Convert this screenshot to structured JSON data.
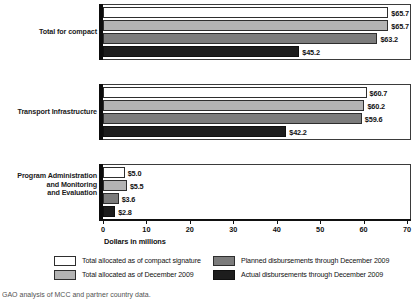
{
  "chart_data": {
    "type": "bar",
    "orientation": "horizontal",
    "title": "",
    "xlabel": "Dollars in millions",
    "ylabel": "",
    "xlim": [
      0,
      70
    ],
    "xticks": [
      "0",
      "10",
      "20",
      "30",
      "40",
      "50",
      "60",
      "70"
    ],
    "grid": false,
    "legend_position": "bottom",
    "categories": [
      "Total for compact",
      "Transport Infrastructure",
      "Program Administration and Monitoring and Evaluation"
    ],
    "series": [
      {
        "name": "Total allocated as of compact signature",
        "color": "#ffffff",
        "values": [
          65.7,
          60.7,
          5.0
        ],
        "labels": [
          "$65.7",
          "$60.7",
          "$5.0"
        ]
      },
      {
        "name": "Total allocated as of December 2009",
        "color": "#b3b3b3",
        "values": [
          65.7,
          60.2,
          5.5
        ],
        "labels": [
          "$65.7",
          "$60.2",
          "$5.5"
        ]
      },
      {
        "name": "Planned disbursements through December 2009",
        "color": "#7c7c7c",
        "values": [
          63.2,
          59.6,
          3.6
        ],
        "labels": [
          "$63.2",
          "$59.6",
          "$3.6"
        ]
      },
      {
        "name": "Actual disbursements through December 2009",
        "color": "#1d1d1d",
        "values": [
          45.2,
          42.2,
          2.8
        ],
        "labels": [
          "$45.2",
          "$42.2",
          "$2.8"
        ]
      }
    ]
  },
  "axis": {
    "title": "Dollars in millions",
    "ticks": [
      "0",
      "10",
      "20",
      "30",
      "40",
      "50",
      "60",
      "70"
    ]
  },
  "categories": {
    "c0": "Total for compact",
    "c1": "Transport Infrastructure",
    "c2_line0": "Program Administration",
    "c2_line1": "and Monitoring",
    "c2_line2": "and Evaluation"
  },
  "legend": {
    "items": [
      {
        "label": "Total allocated as of compact signature",
        "swatch": "s0"
      },
      {
        "label": "Total allocated as of December 2009",
        "swatch": "s1"
      },
      {
        "label": "Planned disbursements through December 2009",
        "swatch": "s2"
      },
      {
        "label": "Actual disbursements through December 2009",
        "swatch": "s3"
      }
    ]
  },
  "footer": {
    "note": "GAO analysis of MCC and partner country data."
  }
}
